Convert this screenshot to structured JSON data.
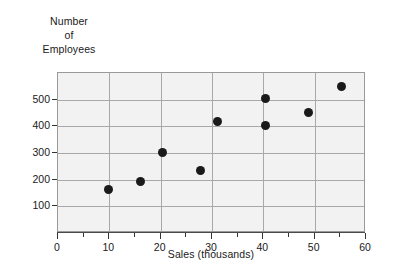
{
  "chart_data": {
    "type": "scatter",
    "title": "",
    "xlabel": "Sales (thousands)",
    "ylabel": "Number of Employees",
    "ylabel_lines": [
      "Number",
      "of",
      "Employees"
    ],
    "xlim": [
      0,
      60
    ],
    "ylim": [
      0,
      600
    ],
    "grid": true,
    "legend": null,
    "xticks": [
      0,
      10,
      20,
      30,
      40,
      50,
      60
    ],
    "xtick_labels": [
      "0",
      "10",
      "20",
      "30",
      "40",
      "50",
      "60"
    ],
    "xminor_ticks": [
      5,
      15,
      25,
      35,
      45,
      55
    ],
    "yticks": [
      100,
      200,
      300,
      400,
      500
    ],
    "ytick_labels": [
      "100",
      "200",
      "300",
      "400",
      "500"
    ],
    "points": [
      {
        "x": 10.0,
        "y": 160
      },
      {
        "x": 16.3,
        "y": 190
      },
      {
        "x": 20.6,
        "y": 300
      },
      {
        "x": 28.0,
        "y": 230
      },
      {
        "x": 31.3,
        "y": 415
      },
      {
        "x": 40.6,
        "y": 500
      },
      {
        "x": 40.6,
        "y": 400
      },
      {
        "x": 49.0,
        "y": 450
      },
      {
        "x": 55.5,
        "y": 545
      }
    ],
    "marker_color": "#1a1a1a",
    "plot_background": "#f2f2f2",
    "grid_color": "#a8a8a8"
  }
}
